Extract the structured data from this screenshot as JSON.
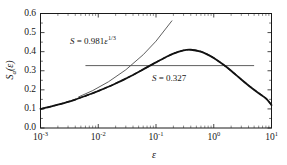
{
  "figure": {
    "background_color": "#ffffff",
    "frame_color": "#1a1a1a",
    "curve_color": "#111111",
    "line_color": "#4d4d4d"
  },
  "axes": {
    "x": {
      "label": "ε",
      "scale": "log",
      "range": [
        0.001,
        10
      ],
      "tick_values": [
        0.001,
        0.01,
        0.1,
        1,
        10
      ],
      "tick_mantissas": [
        "10",
        "10",
        "10",
        "10",
        "10"
      ],
      "tick_exponents": [
        "-3",
        "-2",
        "-1",
        "0",
        "1"
      ]
    },
    "y": {
      "label_main": "S",
      "label_sub": "a",
      "label_arg": "(ε)",
      "scale": "linear",
      "range": [
        0.0,
        0.6
      ],
      "tick_values": [
        0.0,
        0.1,
        0.2,
        0.3,
        0.4,
        0.5,
        0.6
      ],
      "tick_labels": [
        "0.0",
        "0.1",
        "0.2",
        "0.3",
        "0.4",
        "0.5",
        "0.6"
      ]
    }
  },
  "annotations": {
    "power_law": {
      "prefix": "S",
      "equals": " = ",
      "coefficient": "0.981",
      "variable": "ε",
      "exponent": "1/3",
      "full_text": "S = 0.981ε^1/3"
    },
    "plateau": {
      "prefix": "S",
      "equals": " = ",
      "value": "0.327",
      "full_text": "S = 0.327"
    }
  },
  "chart_data": {
    "type": "line",
    "title": "",
    "xlabel": "ε",
    "ylabel": "S_a(ε)",
    "xscale": "log",
    "yscale": "linear",
    "xlim": [
      0.001,
      10
    ],
    "ylim": [
      0.0,
      0.6
    ],
    "grid": false,
    "legend": "none",
    "series": [
      {
        "name": "S_a(ε) numerical",
        "style": "solid",
        "color": "#111111",
        "linewidth": 1.8,
        "x": [
          0.001,
          0.0015,
          0.002,
          0.003,
          0.004,
          0.006,
          0.008,
          0.01,
          0.015,
          0.02,
          0.03,
          0.04,
          0.06,
          0.08,
          0.1,
          0.15,
          0.2,
          0.3,
          0.4,
          0.6,
          0.8,
          1.0,
          1.5,
          2.0,
          3.0,
          4.0,
          6.0,
          8.0,
          10.0
        ],
        "y": [
          0.1,
          0.112,
          0.122,
          0.137,
          0.149,
          0.168,
          0.182,
          0.194,
          0.216,
          0.233,
          0.259,
          0.278,
          0.307,
          0.328,
          0.344,
          0.372,
          0.39,
          0.407,
          0.41,
          0.4,
          0.383,
          0.367,
          0.33,
          0.3,
          0.254,
          0.223,
          0.182,
          0.155,
          0.12
        ]
      },
      {
        "name": "S_a(ε) asymptotic fit",
        "style": "dashed",
        "color": "#2b2b2b",
        "linewidth": 1.4,
        "x": [
          0.001,
          0.002,
          0.004,
          0.008,
          0.015,
          0.03,
          0.06,
          0.1,
          0.2,
          0.3,
          0.4,
          0.6,
          1.0,
          2.0,
          4.0,
          8.0,
          10.0
        ],
        "y": [
          0.1,
          0.122,
          0.149,
          0.182,
          0.216,
          0.259,
          0.307,
          0.344,
          0.39,
          0.407,
          0.41,
          0.4,
          0.367,
          0.3,
          0.223,
          0.155,
          0.12
        ]
      },
      {
        "name": "power law S = 0.981ε^(1/3)",
        "style": "solid-thin",
        "color": "#4d4d4d",
        "linewidth": 0.9,
        "x": [
          0.0045,
          0.008,
          0.015,
          0.03,
          0.06,
          0.1,
          0.19
        ],
        "y": [
          0.162,
          0.196,
          0.242,
          0.305,
          0.384,
          0.455,
          0.563
        ]
      },
      {
        "name": "plateau S = 0.327",
        "style": "solid-thin",
        "color": "#4d4d4d",
        "linewidth": 0.9,
        "x": [
          0.006,
          5.0
        ],
        "y": [
          0.327,
          0.327
        ]
      }
    ],
    "annotations": [
      {
        "text": "S = 0.981ε^(1/3)",
        "x": 0.022,
        "y": 0.485
      },
      {
        "text": "S = 0.327",
        "x": 0.42,
        "y": 0.292
      }
    ],
    "peak": {
      "x": 0.33,
      "y": 0.41
    },
    "endpoints": {
      "left": {
        "x": 0.001,
        "y": 0.1
      },
      "right": {
        "x": 10.0,
        "y": 0.12
      }
    }
  }
}
